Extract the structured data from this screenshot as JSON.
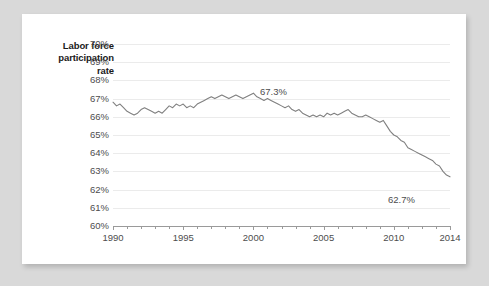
{
  "chart_data": {
    "type": "line",
    "title": "",
    "ylabel": "Labor force participation rate",
    "xlabel": "",
    "ylim": [
      60,
      70
    ],
    "xlim": [
      1990,
      2014
    ],
    "grid": true,
    "legend": false,
    "y_tick_labels": [
      "70%",
      "69%",
      "68%",
      "67%",
      "66%",
      "65%",
      "64%",
      "63%",
      "62%",
      "61%",
      "60%"
    ],
    "y_tick_values": [
      70,
      69,
      68,
      67,
      66,
      65,
      64,
      63,
      62,
      61,
      60
    ],
    "x_tick_labels": [
      "1990",
      "1995",
      "2000",
      "2005",
      "2010",
      "2014"
    ],
    "x_tick_values": [
      1990,
      1995,
      2000,
      2005,
      2010,
      2014
    ],
    "x_minor_ticks": [
      1991,
      1992,
      1993,
      1994,
      1996,
      1997,
      1998,
      1999,
      2001,
      2002,
      2003,
      2004,
      2006,
      2007,
      2008,
      2009,
      2011,
      2012,
      2013
    ],
    "series": [
      {
        "name": "Labor force participation rate",
        "color": "#808080",
        "x": [
          1990.0,
          1990.25,
          1990.5,
          1990.75,
          1991.0,
          1991.25,
          1991.5,
          1991.75,
          1992.0,
          1992.25,
          1992.5,
          1992.75,
          1993.0,
          1993.25,
          1993.5,
          1993.75,
          1994.0,
          1994.25,
          1994.5,
          1994.75,
          1995.0,
          1995.25,
          1995.5,
          1995.75,
          1996.0,
          1996.25,
          1996.5,
          1996.75,
          1997.0,
          1997.25,
          1997.5,
          1997.75,
          1998.0,
          1998.25,
          1998.5,
          1998.75,
          1999.0,
          1999.25,
          1999.5,
          1999.75,
          2000.0,
          2000.25,
          2000.5,
          2000.75,
          2001.0,
          2001.25,
          2001.5,
          2001.75,
          2002.0,
          2002.25,
          2002.5,
          2002.75,
          2003.0,
          2003.25,
          2003.5,
          2003.75,
          2004.0,
          2004.25,
          2004.5,
          2004.75,
          2005.0,
          2005.25,
          2005.5,
          2005.75,
          2006.0,
          2006.25,
          2006.5,
          2006.75,
          2007.0,
          2007.25,
          2007.5,
          2007.75,
          2008.0,
          2008.25,
          2008.5,
          2008.75,
          2009.0,
          2009.25,
          2009.5,
          2009.75,
          2010.0,
          2010.25,
          2010.5,
          2010.75,
          2011.0,
          2011.25,
          2011.5,
          2011.75,
          2012.0,
          2012.25,
          2012.5,
          2012.75,
          2013.0,
          2013.25,
          2013.5,
          2013.75,
          2014.0
        ],
        "y": [
          66.8,
          66.6,
          66.7,
          66.5,
          66.3,
          66.2,
          66.1,
          66.2,
          66.4,
          66.5,
          66.4,
          66.3,
          66.2,
          66.3,
          66.2,
          66.4,
          66.6,
          66.5,
          66.7,
          66.6,
          66.7,
          66.5,
          66.6,
          66.5,
          66.7,
          66.8,
          66.9,
          67.0,
          67.1,
          67.0,
          67.1,
          67.2,
          67.1,
          67.0,
          67.1,
          67.2,
          67.1,
          67.0,
          67.1,
          67.2,
          67.3,
          67.1,
          67.0,
          66.9,
          67.0,
          66.9,
          66.8,
          66.7,
          66.6,
          66.5,
          66.6,
          66.4,
          66.3,
          66.4,
          66.2,
          66.1,
          66.0,
          66.1,
          66.0,
          66.1,
          66.0,
          66.2,
          66.1,
          66.2,
          66.1,
          66.2,
          66.3,
          66.4,
          66.2,
          66.1,
          66.0,
          66.0,
          66.1,
          66.0,
          65.9,
          65.8,
          65.7,
          65.8,
          65.5,
          65.2,
          65.0,
          64.9,
          64.7,
          64.6,
          64.3,
          64.2,
          64.1,
          64.0,
          63.9,
          63.8,
          63.7,
          63.6,
          63.4,
          63.3,
          63.0,
          62.8,
          62.7
        ]
      }
    ],
    "annotations": [
      {
        "text": "67.3%",
        "x": 2000.0,
        "y": 67.3
      },
      {
        "text": "62.7%",
        "x": 2014.0,
        "y": 62.7
      }
    ]
  },
  "axis": {
    "title_line1": "Labor force",
    "title_line2": "participation",
    "title_line3": "rate"
  },
  "colors": {
    "page_background": "#d9d9d9",
    "card_background": "#ffffff",
    "series_line": "#808080",
    "gridline": "#ebebeb",
    "axis_line": "#9a9a9a",
    "tick_text": "#4d4d4d",
    "title_text": "#1a1a1a"
  }
}
